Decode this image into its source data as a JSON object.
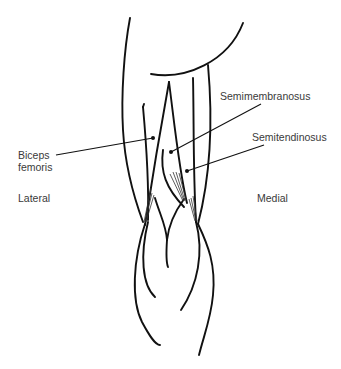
{
  "figure": {
    "labels": {
      "semimembranosus": "Semimembranosus",
      "semitendinosus": "Semitendinosus",
      "biceps_line1": "Biceps",
      "biceps_line2": "femoris",
      "lateral": "Lateral",
      "medial": "Medial"
    },
    "colors": {
      "stroke": "#111111",
      "text": "#3a3a3a",
      "background": "#ffffff"
    }
  }
}
